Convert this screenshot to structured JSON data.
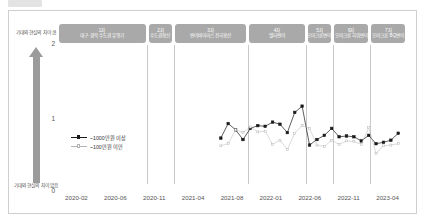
{
  "figure": {
    "top_tab_label": ""
  },
  "axis": {
    "y_caption_top": "기대와 현실의 차이 큼",
    "y_caption_bottom": "기대와 현실의 차이 없음",
    "y_ticks": [
      "2",
      "1",
      "0"
    ],
    "x_ticks": [
      "2020-02",
      "2020-06",
      "2020-11",
      "2021-04",
      "2021-08",
      "2022-01",
      "2022-06",
      "2022-11",
      "2023-04"
    ]
  },
  "waves": [
    {
      "no": "1차",
      "name": "대구·경북 수도권 유행기"
    },
    {
      "no": "2차",
      "name": "수도권확산"
    },
    {
      "no": "3차",
      "name": "변이바이러스 전국확산"
    },
    {
      "no": "4차",
      "name": "델타변이"
    },
    {
      "no": "5차",
      "name": "오미크론변이"
    },
    {
      "no": "6차",
      "name": "오미크론 하위변이"
    },
    {
      "no": "7차",
      "name": "오미크론 BQ변이"
    }
  ],
  "legend": [
    {
      "label": "~1000만원 이상",
      "color": "#1a1a1a",
      "marker": "filled-square"
    },
    {
      "label": "~100만원 미만",
      "color": "#b4b4b4",
      "marker": "open-square"
    }
  ],
  "colors": {
    "series_high": "#1a1a1a",
    "series_low": "#b4b4b4",
    "band": "#a9a9a9",
    "arrow": "#9b9b9b",
    "grid": "#c9c9c9",
    "frame": "#cfcfcf"
  },
  "chart_data": {
    "type": "line",
    "title": "",
    "subtitle": "",
    "xlabel": "",
    "ylabel": "기대와 현실의 차이",
    "ylim": [
      0,
      2
    ],
    "grid": false,
    "legend_position": "inside-left",
    "annotations": [
      "기대와 현실의 차이 큼",
      "기대와 현실의 차이 없음"
    ],
    "x": [
      "2021-05",
      "2021-06",
      "2021-07",
      "2021-08",
      "2021-09",
      "2021-10",
      "2021-11",
      "2021-12",
      "2022-01",
      "2022-02",
      "2022-03",
      "2022-04",
      "2022-05",
      "2022-06",
      "2022-07",
      "2022-08",
      "2022-09",
      "2022-10",
      "2022-11",
      "2022-12",
      "2023-01",
      "2023-02",
      "2023-03",
      "2023-04",
      "2023-05"
    ],
    "series": [
      {
        "name": "~1000만원 이상",
        "color": "#1a1a1a",
        "values": [
          0.66,
          0.87,
          0.78,
          0.64,
          0.8,
          0.84,
          0.83,
          0.89,
          0.86,
          0.74,
          1.03,
          1.12,
          0.56,
          0.64,
          0.7,
          0.8,
          0.68,
          0.69,
          0.68,
          0.62,
          0.7,
          0.58,
          0.6,
          0.63,
          0.73
        ]
      },
      {
        "name": "~100만원 미만",
        "color": "#b4b4b4",
        "values": [
          0.55,
          0.58,
          0.78,
          0.74,
          0.82,
          0.75,
          0.76,
          0.57,
          0.63,
          0.5,
          0.73,
          0.84,
          0.8,
          0.56,
          0.54,
          0.63,
          0.57,
          0.62,
          0.61,
          0.57,
          0.81,
          0.44,
          0.55,
          0.56,
          0.58
        ]
      }
    ],
    "wave_bands": [
      {
        "label": "1차 대구·경북 수도권 유행기",
        "start": "2020-01",
        "end": "2020-08"
      },
      {
        "label": "2차 수도권확산",
        "start": "2020-08",
        "end": "2020-10"
      },
      {
        "label": "3차 변이바이러스 전국확산",
        "start": "2020-10",
        "end": "2021-06"
      },
      {
        "label": "4차 델타변이",
        "start": "2021-06",
        "end": "2021-12"
      },
      {
        "label": "5차 오미크론변이",
        "start": "2021-12",
        "end": "2022-05"
      },
      {
        "label": "6차 오미크론 하위변이",
        "start": "2022-05",
        "end": "2022-11"
      },
      {
        "label": "7차 오미크론 BQ변이",
        "start": "2022-11",
        "end": "2023-06"
      }
    ]
  }
}
